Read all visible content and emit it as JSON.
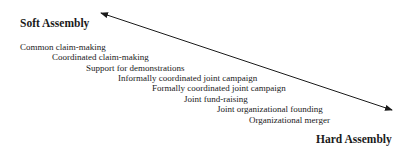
{
  "diagram": {
    "poles": {
      "soft": "Soft Assembly",
      "hard": "Hard Assembly"
    },
    "arrow": {
      "type": "double-headed",
      "start": [
        101,
        13
      ],
      "end": [
        392,
        110
      ],
      "color": "#1a1a1a"
    },
    "steps": [
      {
        "label": "Common claim-making",
        "x": 20,
        "y": 43
      },
      {
        "label": "Coordinated claim-making",
        "x": 52,
        "y": 53
      },
      {
        "label": "Support for demonstrations",
        "x": 86,
        "y": 64
      },
      {
        "label": "Informally coordinated joint campaign",
        "x": 118,
        "y": 74
      },
      {
        "label": "Formally coordinated joint campaign",
        "x": 152,
        "y": 84
      },
      {
        "label": "Joint fund-raising",
        "x": 184,
        "y": 95
      },
      {
        "label": "Joint organizational founding",
        "x": 217,
        "y": 105
      },
      {
        "label": "Organizational merger",
        "x": 249,
        "y": 116
      }
    ]
  }
}
